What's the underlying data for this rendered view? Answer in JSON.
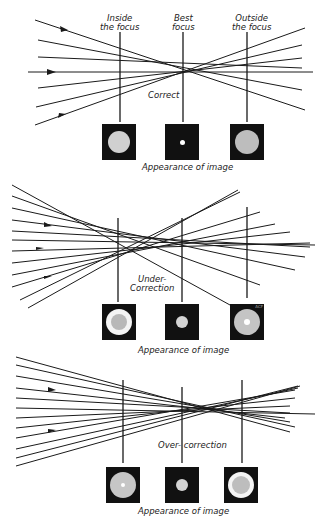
{
  "panels": [
    {
      "id": "correct",
      "title": "Correct",
      "column_labels": [
        {
          "line1": "Inside",
          "line2": "the focus"
        },
        {
          "line1": "Best",
          "line2": "focus"
        },
        {
          "line1": "Outside",
          "line2": "the focus"
        }
      ],
      "caption": "Appearance of image",
      "images": [
        "large uniform disc",
        "small bright point",
        "large uniform disc"
      ]
    },
    {
      "id": "under",
      "title_line1": "Under-",
      "title_line2": "Correction",
      "caption": "Appearance of image",
      "images": [
        "disc with bright outer ring",
        "small disc",
        "disc with bright center"
      ],
      "signature": "ACF"
    },
    {
      "id": "over",
      "title": "Over- correction",
      "caption": "Appearance of image",
      "images": [
        "disc with bright center",
        "small disc",
        "disc with bright outer ring"
      ]
    }
  ],
  "colors": {
    "ink": "#111111",
    "disc": "#c8c8c8",
    "ring": "#f4f4f4",
    "paper": "#ffffff"
  }
}
